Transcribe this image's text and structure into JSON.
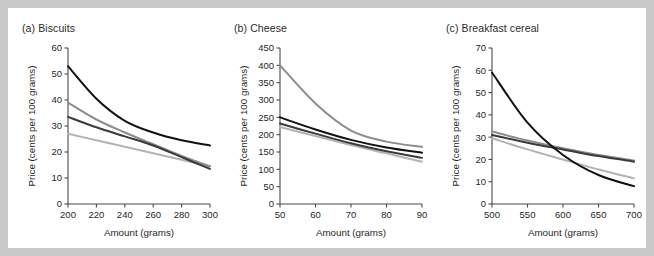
{
  "figure": {
    "background_color": "#c9c9c9",
    "card_color": "#ffffff",
    "axis_color": "#4a4a4a",
    "text_color": "#1f1f1f"
  },
  "series_colors": {
    "series_1": "#111111",
    "series_2": "#8c8c8c",
    "series_3": "#3a3a3a",
    "series_4": "#b3b3b3"
  },
  "panels": [
    {
      "id": "biscuits",
      "title": "(a) Biscuits",
      "chart_index": 0
    },
    {
      "id": "cheese",
      "title": "(b) Cheese",
      "chart_index": 1
    },
    {
      "id": "breakfast-cereal",
      "title": "(c) Breakfast cereal",
      "chart_index": 2
    }
  ],
  "chart_data": [
    {
      "type": "line",
      "title": "(a) Biscuits",
      "xlabel": "Amount (grams)",
      "ylabel": "Price (cents per 100 grams)",
      "xlim": [
        200,
        300
      ],
      "ylim": [
        0,
        60
      ],
      "xticks": [
        200,
        220,
        240,
        260,
        280,
        300
      ],
      "yticks": [
        0,
        10,
        20,
        30,
        40,
        50,
        60
      ],
      "grid": false,
      "legend": "none",
      "x": [
        200,
        220,
        240,
        260,
        280,
        300
      ],
      "series": [
        {
          "name": "series_1",
          "color": "#111111",
          "values": [
            53.0,
            40.5,
            32.0,
            27.5,
            24.5,
            22.5
          ]
        },
        {
          "name": "series_2",
          "color": "#8c8c8c",
          "values": [
            39.0,
            32.5,
            27.5,
            23.0,
            18.5,
            14.5
          ]
        },
        {
          "name": "series_3",
          "color": "#3a3a3a",
          "values": [
            33.5,
            29.5,
            26.0,
            22.5,
            18.0,
            13.5
          ]
        },
        {
          "name": "series_4",
          "color": "#b3b3b3",
          "values": [
            27.0,
            24.5,
            22.0,
            19.5,
            17.0,
            14.5
          ]
        }
      ]
    },
    {
      "type": "line",
      "title": "(b) Cheese",
      "xlabel": "Amount (grams)",
      "ylabel": "Price (cents per 100 grams)",
      "xlim": [
        50,
        90
      ],
      "ylim": [
        0,
        450
      ],
      "xticks": [
        50,
        60,
        70,
        80,
        90
      ],
      "yticks": [
        0,
        50,
        100,
        150,
        200,
        250,
        300,
        350,
        400,
        450
      ],
      "grid": false,
      "legend": "none",
      "x": [
        50,
        60,
        70,
        80,
        90
      ],
      "series": [
        {
          "name": "series_1",
          "color": "#111111",
          "values": [
            250,
            215,
            185,
            163,
            148
          ]
        },
        {
          "name": "series_2",
          "color": "#8c8c8c",
          "values": [
            400,
            290,
            212,
            180,
            165
          ]
        },
        {
          "name": "series_3",
          "color": "#3a3a3a",
          "values": [
            232,
            203,
            175,
            152,
            133
          ]
        },
        {
          "name": "series_4",
          "color": "#b3b3b3",
          "values": [
            222,
            196,
            170,
            146,
            122
          ]
        }
      ]
    },
    {
      "type": "line",
      "title": "(c) Breakfast cereal",
      "xlabel": "Amount (grams)",
      "ylabel": "Price (cents per 100 grams)",
      "xlim": [
        500,
        700
      ],
      "ylim": [
        0,
        70
      ],
      "xticks": [
        500,
        550,
        600,
        650,
        700
      ],
      "yticks": [
        0,
        10,
        20,
        30,
        40,
        50,
        60,
        70
      ],
      "grid": false,
      "legend": "none",
      "x": [
        500,
        550,
        600,
        650,
        700
      ],
      "series": [
        {
          "name": "series_1",
          "color": "#111111",
          "values": [
            59.0,
            36.5,
            22.0,
            13.0,
            8.0
          ]
        },
        {
          "name": "series_2",
          "color": "#8c8c8c",
          "values": [
            32.5,
            28.5,
            25.0,
            22.0,
            19.5
          ]
        },
        {
          "name": "series_3",
          "color": "#3a3a3a",
          "values": [
            31.0,
            27.5,
            24.5,
            21.5,
            19.0
          ]
        },
        {
          "name": "series_4",
          "color": "#b3b3b3",
          "values": [
            29.5,
            24.5,
            20.0,
            15.5,
            11.5
          ]
        }
      ]
    }
  ]
}
